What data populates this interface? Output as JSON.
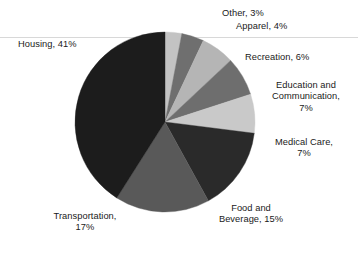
{
  "chart_data": {
    "type": "pie",
    "title": "",
    "subtitle": "",
    "xlabel": "",
    "ylabel": "",
    "legend_position": "none",
    "grid": false,
    "units": "percent",
    "start_angle_deg": 0,
    "direction": "clockwise",
    "categories": [
      "Other",
      "Apparel",
      "Recreation",
      "Education and Communication",
      "Medical Care",
      "Food and Beverage",
      "Transportation",
      "Housing"
    ],
    "values": [
      3,
      4,
      6,
      7,
      7,
      15,
      17,
      41
    ],
    "colors": [
      "#c3c3c3",
      "#6f6f6f",
      "#b5b5b5",
      "#6e6e6e",
      "#c9c9c9",
      "#2a2a2a",
      "#595959",
      "#1c1c1c"
    ],
    "slices": [
      {
        "label": "Other",
        "value": 3,
        "color": "#c3c3c3"
      },
      {
        "label": "Apparel",
        "value": 4,
        "color": "#6f6f6f"
      },
      {
        "label": "Recreation",
        "value": 6,
        "color": "#b5b5b5"
      },
      {
        "label": "Education and Communication",
        "value": 7,
        "color": "#6e6e6e"
      },
      {
        "label": "Medical Care",
        "value": 7,
        "color": "#c9c9c9"
      },
      {
        "label": "Food and Beverage",
        "value": 15,
        "color": "#2a2a2a"
      },
      {
        "label": "Transportation",
        "value": 17,
        "color": "#595959"
      },
      {
        "label": "Housing",
        "value": 41,
        "color": "#1c1c1c"
      }
    ]
  },
  "labels": {
    "other": "Other, 3%",
    "apparel": "Apparel, 4%",
    "housing": "Housing, 41%",
    "recreation": "Recreation, 6%",
    "education": "Education and\nCommunication,\n7%",
    "medical": "Medical Care,\n7%",
    "food": "Food and\nBeverage, 15%",
    "transportation": "Transportation,\n17%"
  },
  "geometry": {
    "center_x": 165,
    "center_y": 122,
    "radius": 90
  }
}
